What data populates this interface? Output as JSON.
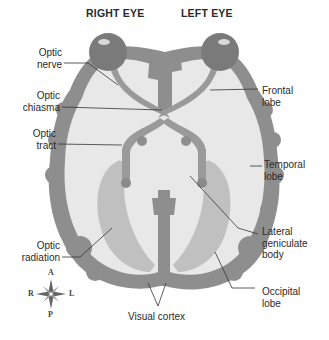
{
  "diagram": {
    "type": "anatomical-illustration",
    "headers": {
      "right_eye": "RIGHT EYE",
      "left_eye": "LEFT EYE"
    },
    "labels_left": [
      {
        "id": "optic-nerve",
        "line1": "Optic",
        "line2": "nerve"
      },
      {
        "id": "optic-chiasma",
        "line1": "Optic",
        "line2": "chiasma"
      },
      {
        "id": "optic-tract",
        "line1": "Optic",
        "line2": "tract"
      },
      {
        "id": "optic-radiation",
        "line1": "Optic",
        "line2": "radiation"
      }
    ],
    "labels_right": [
      {
        "id": "frontal-lobe",
        "line1": "Frontal",
        "line2": "lobe"
      },
      {
        "id": "temporal-lobe",
        "line1": "Temporal",
        "line2": "lobe"
      },
      {
        "id": "lateral-geniculate-body",
        "line1": "Lateral",
        "line2": "geniculate",
        "line3": "body"
      },
      {
        "id": "occipital-lobe",
        "line1": "Occipital",
        "line2": "lobe"
      }
    ],
    "bottom_label": "Visual cortex",
    "compass": {
      "anterior": "A",
      "posterior": "P",
      "right": "R",
      "left": "L"
    },
    "colors": {
      "cortex": "#8a8a8a",
      "white_matter": "#e6e6e6",
      "eye": "#7a7a7a",
      "nerve": "#9a9a9a",
      "radiation": "#b4b4b4",
      "leader_line": "#333333"
    }
  }
}
